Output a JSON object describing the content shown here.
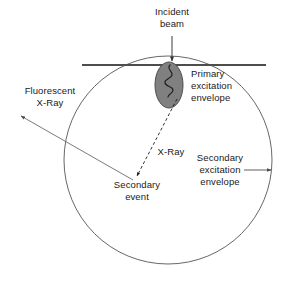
{
  "diagram": {
    "colors": {
      "stroke": "#4d4d4d",
      "text": "#1a1a1a",
      "blob_fill": "#808080",
      "blob_stroke": "#4d4d4d",
      "squiggle": "#1a1a1a",
      "background": "#ffffff"
    },
    "labels": {
      "incident_beam": "Incident\nbeam",
      "incident_beam_line1": "Incident",
      "incident_beam_line2": "beam",
      "primary_envelope_line1": "Primary",
      "primary_envelope_line2": "excitation",
      "primary_envelope_line3": "envelope",
      "fluorescent_xray_line1": "Fluorescent",
      "fluorescent_xray_line2": "X-Ray",
      "xray": "X-Ray",
      "secondary_event_line1": "Secondary",
      "secondary_event_line2": "event",
      "secondary_envelope_line1": "Secondary",
      "secondary_envelope_line2": "excitation",
      "secondary_envelope_line3": "envelope"
    },
    "shapes": {
      "surface_line": {
        "x1": 82,
        "y1": 65,
        "x2": 266,
        "y2": 65
      },
      "secondary_envelope_circle": {
        "cx": 168,
        "cy": 160,
        "r": 104
      },
      "primary_envelope_blob": {
        "cx": 169,
        "cy": 85,
        "rx": 14,
        "ry": 23
      },
      "incident_beam_arrow": {
        "x1": 172,
        "y1": 36,
        "x2": 172,
        "y2": 62
      },
      "fluorescent_xray_arrow": {
        "x1": 133,
        "y1": 180,
        "x2": 19,
        "y2": 114
      },
      "xray_dashed_arrow": {
        "x1": 177,
        "y1": 100,
        "x2": 136,
        "y2": 178
      },
      "secondary_envelope_pointer": {
        "x1": 244,
        "y1": 170,
        "x2": 270,
        "y2": 170
      }
    }
  }
}
